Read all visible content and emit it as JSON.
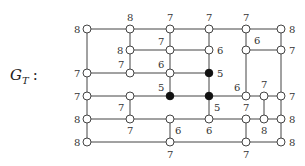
{
  "title": {
    "main": "G",
    "subscript": "T",
    "suffix": ":"
  },
  "nodes": [
    {
      "id": "a1",
      "x": 87,
      "y": 29,
      "label": "8",
      "lx": -13,
      "ly": 4,
      "filled": false
    },
    {
      "id": "a2",
      "x": 130,
      "y": 29,
      "label": "8",
      "lx": -3,
      "ly": -8,
      "filled": false
    },
    {
      "id": "a3",
      "x": 170,
      "y": 29,
      "label": "7",
      "lx": -3,
      "ly": -8,
      "filled": false
    },
    {
      "id": "a4",
      "x": 209,
      "y": 29,
      "label": "7",
      "lx": -3,
      "ly": -8,
      "filled": false
    },
    {
      "id": "a5",
      "x": 246,
      "y": 29,
      "label": "7",
      "lx": -3,
      "ly": -8,
      "filled": false
    },
    {
      "id": "a6",
      "x": 281,
      "y": 29,
      "label": "8",
      "lx": 8,
      "ly": 4,
      "filled": false
    },
    {
      "id": "b2",
      "x": 130,
      "y": 50,
      "label": "8",
      "lx": -13,
      "ly": 4,
      "filled": false
    },
    {
      "id": "b3",
      "x": 170,
      "y": 50,
      "label": "7",
      "lx": -12,
      "ly": -5,
      "filled": false
    },
    {
      "id": "b4",
      "x": 209,
      "y": 50,
      "label": "6",
      "lx": 8,
      "ly": 4,
      "filled": false
    },
    {
      "id": "b5",
      "x": 246,
      "y": 50,
      "label": "6",
      "lx": 8,
      "ly": -6,
      "filled": false
    },
    {
      "id": "b6",
      "x": 281,
      "y": 50,
      "label": "7",
      "lx": 8,
      "ly": 4,
      "filled": false
    },
    {
      "id": "c1",
      "x": 87,
      "y": 73,
      "label": "7",
      "lx": -13,
      "ly": 4,
      "filled": false
    },
    {
      "id": "c2",
      "x": 130,
      "y": 73,
      "label": "7",
      "lx": -12,
      "ly": -5,
      "filled": false
    },
    {
      "id": "c3",
      "x": 170,
      "y": 73,
      "label": "6",
      "lx": -12,
      "ly": -5,
      "filled": false
    },
    {
      "id": "c4",
      "x": 209,
      "y": 73,
      "label": "5",
      "lx": 8,
      "ly": 4,
      "filled": true
    },
    {
      "id": "d1",
      "x": 87,
      "y": 96,
      "label": "7",
      "lx": -13,
      "ly": 4,
      "filled": false
    },
    {
      "id": "d2",
      "x": 130,
      "y": 96,
      "label": "7",
      "lx": -12,
      "ly": 15,
      "filled": false
    },
    {
      "id": "d3",
      "x": 170,
      "y": 96,
      "label": "5",
      "lx": -12,
      "ly": -5,
      "filled": true
    },
    {
      "id": "d4",
      "x": 209,
      "y": 96,
      "label": "5",
      "lx": 5,
      "ly": 15,
      "filled": true
    },
    {
      "id": "d5",
      "x": 246,
      "y": 96,
      "label": "6",
      "lx": -12,
      "ly": -5,
      "filled": false
    },
    {
      "id": "d6",
      "x": 264,
      "y": 96,
      "label": "7",
      "lx": -3,
      "ly": -8,
      "filled": false
    },
    {
      "id": "d7",
      "x": 281,
      "y": 96,
      "label": "7",
      "lx": 8,
      "ly": 4,
      "filled": false
    },
    {
      "id": "e1",
      "x": 87,
      "y": 119,
      "label": "8",
      "lx": -13,
      "ly": 4,
      "filled": false
    },
    {
      "id": "e2",
      "x": 130,
      "y": 119,
      "label": "7",
      "lx": -3,
      "ly": 15,
      "filled": false
    },
    {
      "id": "e3",
      "x": 170,
      "y": 119,
      "label": "6",
      "lx": 5,
      "ly": 15,
      "filled": false
    },
    {
      "id": "e4",
      "x": 209,
      "y": 119,
      "label": "6",
      "lx": -3,
      "ly": 15,
      "filled": false
    },
    {
      "id": "e5",
      "x": 246,
      "y": 119,
      "label": "7",
      "lx": -3,
      "ly": -8,
      "filled": false
    },
    {
      "id": "e6",
      "x": 264,
      "y": 119,
      "label": "8",
      "lx": -3,
      "ly": 15,
      "filled": false
    },
    {
      "id": "e7",
      "x": 281,
      "y": 119,
      "label": "8",
      "lx": 8,
      "ly": 4,
      "filled": false
    },
    {
      "id": "f1",
      "x": 87,
      "y": 142,
      "label": "8",
      "lx": -13,
      "ly": 4,
      "filled": false
    },
    {
      "id": "f3",
      "x": 170,
      "y": 142,
      "label": "7",
      "lx": -3,
      "ly": 16,
      "filled": false
    },
    {
      "id": "f5",
      "x": 246,
      "y": 142,
      "label": "7",
      "lx": -3,
      "ly": 16,
      "filled": false
    },
    {
      "id": "f7",
      "x": 281,
      "y": 142,
      "label": "8",
      "lx": 8,
      "ly": 4,
      "filled": false
    }
  ],
  "edges": [
    [
      "a1",
      "a2"
    ],
    [
      "a2",
      "a3"
    ],
    [
      "a3",
      "a4"
    ],
    [
      "a4",
      "a5"
    ],
    [
      "a5",
      "a6"
    ],
    [
      "b2",
      "b3"
    ],
    [
      "b3",
      "b4"
    ],
    [
      "b5",
      "b6"
    ],
    [
      "c1",
      "c2"
    ],
    [
      "c2",
      "c3"
    ],
    [
      "c3",
      "c4"
    ],
    [
      "d1",
      "d2"
    ],
    [
      "d2",
      "d3"
    ],
    [
      "d3",
      "d4"
    ],
    [
      "d4",
      "d5"
    ],
    [
      "d5",
      "d6"
    ],
    [
      "d6",
      "d7"
    ],
    [
      "e1",
      "e2"
    ],
    [
      "e2",
      "e3"
    ],
    [
      "e3",
      "e4"
    ],
    [
      "e4",
      "e5"
    ],
    [
      "e5",
      "e6"
    ],
    [
      "e6",
      "e7"
    ],
    [
      "f1",
      "f3"
    ],
    [
      "f3",
      "f5"
    ],
    [
      "f5",
      "f7"
    ],
    [
      "a1",
      "c1"
    ],
    [
      "c1",
      "d1"
    ],
    [
      "d1",
      "e1"
    ],
    [
      "e1",
      "f1"
    ],
    [
      "a2",
      "b2"
    ],
    [
      "b2",
      "c2"
    ],
    [
      "d2",
      "e2"
    ],
    [
      "a3",
      "b3"
    ],
    [
      "b3",
      "c3"
    ],
    [
      "c3",
      "d3"
    ],
    [
      "e3",
      "f3"
    ],
    [
      "a4",
      "b4"
    ],
    [
      "b4",
      "c4"
    ],
    [
      "c4",
      "d4"
    ],
    [
      "d4",
      "e4"
    ],
    [
      "a5",
      "b5"
    ],
    [
      "b5",
      "d5"
    ],
    [
      "e5",
      "f5"
    ],
    [
      "d6",
      "e6"
    ],
    [
      "a6",
      "b6"
    ],
    [
      "b6",
      "d7"
    ],
    [
      "d7",
      "e7"
    ],
    [
      "e7",
      "f7"
    ]
  ]
}
